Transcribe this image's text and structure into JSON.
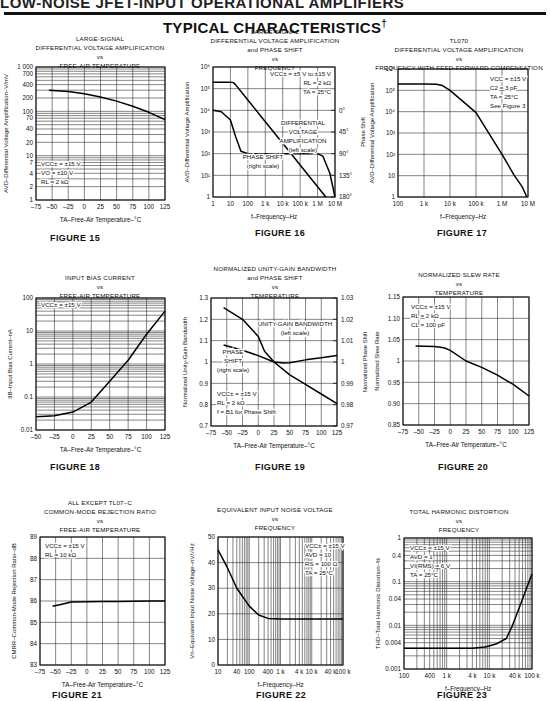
{
  "header": {
    "running_title": "LOW-NOISE JFET-INPUT OPERATIONAL AMPLIFIERS",
    "section_title": "TYPICAL CHARACTERISTICS",
    "section_mark": "†"
  },
  "chart_data": [
    {
      "id": "fig15",
      "figure_label": "FIGURE 15",
      "type": "line",
      "title": "LARGE-SIGNAL\nDIFFERENTIAL VOLTAGE AMPLIFICATION\nvs\nFREE-AIR TEMPERATURE",
      "xlabel": "TA–Free-Air Temperature–°C",
      "ylabel": "AVD–Differential Voltage Amplification–V/mV",
      "xscale": "linear",
      "yscale": "log",
      "xlim": [
        -75,
        125
      ],
      "ylim": [
        1,
        1000
      ],
      "xticks": [
        -75,
        -50,
        -25,
        0,
        25,
        50,
        75,
        100,
        125
      ],
      "xticklabels": [
        "–75",
        "–50",
        "–25",
        "0",
        "25",
        "50",
        "75",
        "100",
        "125"
      ],
      "yticks": [
        1,
        2,
        4,
        7,
        10,
        20,
        40,
        70,
        100,
        200,
        400,
        700,
        1000
      ],
      "yticklabels": [
        "1",
        "2",
        "4",
        "7",
        "10",
        "20",
        "40",
        "70",
        "100",
        "200",
        "400",
        "700",
        "1 000"
      ],
      "annotations": [
        "VCC± = ±15 V",
        "VO = ±10 V",
        "RL = 2 kΩ"
      ],
      "series": [
        {
          "name": "AVD",
          "x": [
            -55,
            -25,
            0,
            25,
            50,
            75,
            100,
            125
          ],
          "y": [
            300,
            280,
            250,
            210,
            170,
            130,
            95,
            65
          ]
        }
      ]
    },
    {
      "id": "fig16",
      "figure_label": "FIGURE 16",
      "type": "line",
      "title": "LARGE-SIGNAL\nDIFFERENTIAL VOLTAGE AMPLIFICATION\nand PHASE SHIFT\nvs\nFREQUENCY",
      "xlabel": "f–Frequency–Hz",
      "ylabel": "AVD–Differential Voltage Amplification",
      "y2label": "Phase Shift",
      "xscale": "log",
      "yscale": "log",
      "xlim": [
        1,
        10000000
      ],
      "ylim": [
        1,
        1000000
      ],
      "xticks": [
        1,
        10,
        100,
        1000,
        10000,
        100000,
        1000000,
        10000000
      ],
      "xticklabels": [
        "1",
        "10",
        "100",
        "1 k",
        "10 k",
        "100 k",
        "1 M",
        "10 M"
      ],
      "yticks": [
        1,
        10,
        100,
        1000,
        10000,
        100000,
        1000000
      ],
      "yticklabels": [
        "1",
        "10¹",
        "10²",
        "10³",
        "10⁴",
        "10⁵",
        "10⁶"
      ],
      "y2lim": [
        180,
        -90
      ],
      "y2ticks": [
        0,
        45,
        90,
        135,
        180
      ],
      "y2ticklabels": [
        "0°",
        "45°",
        "90°",
        "135°",
        "180°"
      ],
      "annotations": [
        "VCC± = ±5 V to ±15 V",
        "RL = 2 kΩ",
        "TA = 25°C",
        "DIFFERENTIAL",
        "VOLTAGE",
        "AMPLIFICATION",
        "(left scale)",
        "PHASE SHIFT",
        "(right scale)"
      ],
      "series": [
        {
          "name": "Differential Voltage Amplification (left scale)",
          "x": [
            1,
            10,
            15,
            20,
            100,
            1000,
            10000,
            100000,
            1000000,
            3000000
          ],
          "y": [
            200000,
            200000,
            190000,
            150000,
            30000,
            3000,
            300,
            30,
            3,
            1
          ]
        },
        {
          "name": "Phase Shift (right scale, degrees)",
          "x": [
            1,
            3,
            10,
            20,
            40,
            100,
            1000,
            10000,
            100000,
            1000000,
            2000000,
            5000000,
            10000000
          ],
          "y": [
            0,
            3,
            20,
            55,
            85,
            90,
            90,
            90,
            90,
            90,
            95,
            130,
            180
          ]
        }
      ]
    },
    {
      "id": "fig17",
      "figure_label": "FIGURE 17",
      "type": "line",
      "title": "TL070\nDIFFERENTIAL VOLTAGE AMPLIFICATION\nvs\nFREQUENCY WITH FEED-FORWARD COMPENSATION",
      "xlabel": "f–Frequency–Hz",
      "ylabel": "AVD–Differential Voltage Amplification",
      "xscale": "log",
      "yscale": "log",
      "xlim": [
        100,
        10000000
      ],
      "ylim": [
        1,
        1000000
      ],
      "xticks": [
        100,
        1000,
        10000,
        100000,
        1000000,
        10000000
      ],
      "xticklabels": [
        "100",
        "1 k",
        "10 k",
        "100 k",
        "1 M",
        "10 M"
      ],
      "yticks": [
        1,
        10,
        100,
        1000,
        10000,
        100000,
        1000000
      ],
      "yticklabels": [
        "1",
        "10",
        "10²",
        "10³",
        "10⁴",
        "10⁵",
        "10⁶"
      ],
      "annotations": [
        "VCC = ±15 V",
        "C2 = 3 pF",
        "TA = 25°C",
        "See Figure 3"
      ],
      "series": [
        {
          "name": "AVD",
          "x": [
            100,
            1000,
            3000,
            5000,
            10000,
            100000,
            1000000,
            3000000,
            6000000,
            9000000
          ],
          "y": [
            200000,
            200000,
            195000,
            170000,
            100000,
            9000,
            100,
            10,
            3,
            1
          ]
        }
      ]
    },
    {
      "id": "fig18",
      "figure_label": "FIGURE 18",
      "type": "line",
      "title": "INPUT BIAS CURRENT\nvs\nFREE-AIR TEMPERATURE",
      "xlabel": "TA–Free-Air Temperature–°C",
      "ylabel": "IIB–Input Bias Current–nA",
      "xscale": "linear",
      "yscale": "log",
      "xlim": [
        -50,
        125
      ],
      "ylim": [
        0.01,
        100
      ],
      "xticks": [
        -50,
        -25,
        0,
        25,
        50,
        75,
        100,
        125
      ],
      "xticklabels": [
        "–50",
        "–25",
        "0",
        "25",
        "50",
        "75",
        "100",
        "125"
      ],
      "yticks": [
        0.01,
        0.1,
        1,
        10,
        100
      ],
      "yticklabels": [
        "0.01",
        "0.1",
        "1",
        "10",
        "100"
      ],
      "annotations": [
        "VCC± = ±15 V"
      ],
      "series": [
        {
          "name": "IIB",
          "x": [
            -50,
            -25,
            0,
            25,
            50,
            75,
            100,
            125
          ],
          "y": [
            0.025,
            0.027,
            0.035,
            0.07,
            0.3,
            1.3,
            8,
            40
          ]
        }
      ]
    },
    {
      "id": "fig19",
      "figure_label": "FIGURE 19",
      "type": "line",
      "title": "NORMALIZED UNITY-GAIN BANDWIDTH\nand PHASE SHIFT\nvs\nTEMPERATURE",
      "xlabel": "TA–Free-Air Temperature–°C",
      "ylabel": "Normalized Unity-Gain Bandwidth",
      "y2label": "Normalized Phase Shift",
      "xscale": "linear",
      "yscale": "linear",
      "xlim": [
        -75,
        125
      ],
      "ylim": [
        0.7,
        1.3
      ],
      "xticks": [
        -75,
        -50,
        -25,
        0,
        25,
        50,
        75,
        100,
        125
      ],
      "xticklabels": [
        "–75",
        "–50",
        "–25",
        "0",
        "25",
        "50",
        "75",
        "100",
        "125"
      ],
      "yticks": [
        0.7,
        0.8,
        0.9,
        1,
        1.1,
        1.2,
        1.3
      ],
      "yticklabels": [
        "0.7",
        "0.8",
        "0.9",
        "1",
        "1.1",
        "1.2",
        "1.3"
      ],
      "y2lim": [
        0.97,
        1.03
      ],
      "y2ticks": [
        0.97,
        0.98,
        0.99,
        1,
        1.01,
        1.02,
        1.03
      ],
      "y2ticklabels": [
        "0.97",
        "0.98",
        "0.99",
        "1",
        "1.01",
        "1.02",
        "1.03"
      ],
      "annotations": [
        "UNITY-GAIN BANDWIDTH",
        "(left scale)",
        "PHASE",
        "SHIFT",
        "(right scale)",
        "VCC± = ±15 V",
        "RL = 2 kΩ",
        "f = B1 for Phase Shift"
      ],
      "series": [
        {
          "name": "Unity-Gain Bandwidth (left scale)",
          "x": [
            -55,
            -25,
            0,
            10,
            25,
            50,
            75,
            100,
            125
          ],
          "y": [
            1.255,
            1.2,
            1.12,
            1.05,
            1.0,
            0.94,
            0.895,
            0.85,
            0.805
          ]
        },
        {
          "name": "Phase Shift (right scale)",
          "x": [
            -55,
            -25,
            0,
            25,
            40,
            50,
            75,
            100,
            125
          ],
          "y": [
            1.008,
            1.0055,
            1.003,
            1.0,
            0.9995,
            0.9997,
            1.001,
            1.002,
            1.003
          ]
        }
      ]
    },
    {
      "id": "fig20",
      "figure_label": "FIGURE 20",
      "type": "line",
      "title": "NORMALIZED SLEW RATE\nvs\nTEMPERATURE",
      "xlabel": "TA–Free-Air Temperature–°C",
      "ylabel": "Normalized Slew Rate",
      "xscale": "linear",
      "yscale": "linear",
      "xlim": [
        -75,
        125
      ],
      "ylim": [
        0.85,
        1.15
      ],
      "xticks": [
        -75,
        -50,
        -25,
        0,
        25,
        50,
        75,
        100,
        125
      ],
      "xticklabels": [
        "–75",
        "–50",
        "–25",
        "0",
        "25",
        "50",
        "75",
        "100",
        "125"
      ],
      "yticks": [
        0.85,
        0.9,
        0.95,
        1,
        1.05,
        1.1,
        1.15
      ],
      "yticklabels": [
        "0.85",
        "0.90",
        "0.95",
        "1",
        "1.05",
        "1.10",
        "1.15"
      ],
      "annotations": [
        "VCC± = ±15 V",
        "RL = 2 kΩ",
        "CL = 100 pF"
      ],
      "series": [
        {
          "name": "Slew Rate",
          "x": [
            -55,
            -25,
            -10,
            0,
            25,
            50,
            75,
            100,
            125
          ],
          "y": [
            1.035,
            1.034,
            1.031,
            1.025,
            1.0,
            0.985,
            0.967,
            0.945,
            0.918
          ]
        }
      ]
    },
    {
      "id": "fig21",
      "figure_label": "FIGURE 21",
      "type": "line",
      "title": "ALL EXCEPT TL07–C\nCOMMON-MODE REJECTION RATIO\nvs\nFREE-AIR TEMPERATURE",
      "xlabel": "TA–Free-Air Temperature–°C",
      "ylabel": "CMRR–Common-Mode Rejection Ratio–dB",
      "xscale": "linear",
      "yscale": "linear",
      "xlim": [
        -75,
        125
      ],
      "ylim": [
        83,
        89
      ],
      "xticks": [
        -75,
        -50,
        -25,
        0,
        25,
        50,
        75,
        100,
        125
      ],
      "xticklabels": [
        "–75",
        "–50",
        "–25",
        "0",
        "25",
        "50",
        "75",
        "100",
        "125"
      ],
      "yticks": [
        83,
        84,
        85,
        86,
        87,
        88,
        89
      ],
      "yticklabels": [
        "83",
        "84",
        "85",
        "86",
        "87",
        "88",
        "89"
      ],
      "annotations": [
        "VCC± = ±15 V",
        "RL = 10 kΩ"
      ],
      "series": [
        {
          "name": "CMRR",
          "x": [
            -55,
            -40,
            -25,
            0,
            25,
            50,
            75,
            100,
            125
          ],
          "y": [
            85.75,
            85.85,
            85.95,
            85.97,
            85.98,
            85.98,
            85.99,
            86.0,
            86.0
          ]
        }
      ]
    },
    {
      "id": "fig22",
      "figure_label": "FIGURE 22",
      "type": "line",
      "title": "EQUIVALENT INPUT NOISE VOLTAGE\nvs\nFREQUENCY",
      "xlabel": "f–Frequency–Hz",
      "ylabel": "Vn–Equivalent Input Noise Voltage–nV/√Hz",
      "xscale": "log",
      "yscale": "linear",
      "xlim": [
        10,
        100000
      ],
      "ylim": [
        0,
        50
      ],
      "xticks": [
        10,
        40,
        100,
        400,
        1000,
        4000,
        10000,
        40000,
        100000
      ],
      "xticklabels": [
        "10",
        "40",
        "100",
        "400",
        "1 k",
        "4 k",
        "10 k",
        "40 k",
        "100 k"
      ],
      "yticks": [
        0,
        10,
        20,
        30,
        40,
        50
      ],
      "yticklabels": [
        "0",
        "10",
        "20",
        "30",
        "40",
        "50"
      ],
      "annotations": [
        "VCC± = ±15 V",
        "AVD = 10",
        "RS = 100 Ω",
        "TA = 25°C"
      ],
      "series": [
        {
          "name": "Vn",
          "x": [
            10,
            20,
            40,
            100,
            200,
            400,
            1000,
            10000,
            100000
          ],
          "y": [
            45,
            38,
            30,
            23,
            19.5,
            18.2,
            18,
            18,
            18
          ]
        }
      ]
    },
    {
      "id": "fig23",
      "figure_label": "FIGURE 23",
      "type": "line",
      "title": "TOTAL HARMONIC DISTORTION\nvs\nFREQUENCY",
      "xlabel": "f–Frequency–Hz",
      "ylabel": "THD–Total Harmonic Distortion–%",
      "xscale": "log",
      "yscale": "log",
      "xlim": [
        100,
        100000
      ],
      "ylim": [
        0.001,
        1
      ],
      "xticks": [
        100,
        400,
        1000,
        4000,
        10000,
        40000,
        100000
      ],
      "xticklabels": [
        "100",
        "400",
        "1 k",
        "4 k",
        "10 k",
        "40 k",
        "100 k"
      ],
      "yticks": [
        0.001,
        0.004,
        0.01,
        0.04,
        0.1,
        0.4,
        1
      ],
      "yticklabels": [
        "0.001",
        "0.004",
        "0.01",
        "0.04",
        "0.1",
        "0.4",
        "1"
      ],
      "annotations": [
        "VCC± = ±15 V",
        "AVD = 1",
        "VI(RMS) = 6 V",
        "TA = 25°C"
      ],
      "series": [
        {
          "name": "THD",
          "x": [
            100,
            1000,
            4000,
            8000,
            15000,
            25000,
            35000,
            50000,
            70000,
            100000
          ],
          "y": [
            0.003,
            0.003,
            0.003,
            0.0032,
            0.0038,
            0.005,
            0.01,
            0.025,
            0.06,
            0.15
          ]
        }
      ]
    }
  ]
}
